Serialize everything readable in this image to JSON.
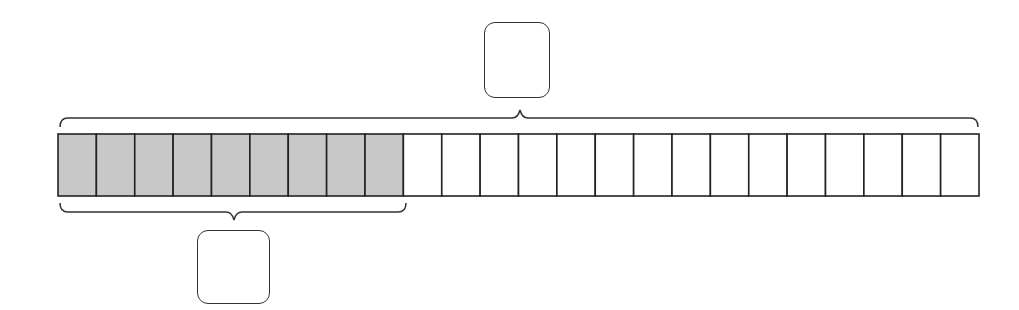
{
  "diagram": {
    "type": "tape-diagram",
    "total_cells": 24,
    "shaded_cells": 9,
    "unshaded_cells": 15,
    "colors": {
      "shaded": "#c8c8c8",
      "unshaded": "#ffffff",
      "stroke": "#222222"
    },
    "top_brace": {
      "spans": "all cells",
      "label_box_value": ""
    },
    "bottom_brace": {
      "spans": "shaded cells",
      "label_box_value": ""
    }
  }
}
